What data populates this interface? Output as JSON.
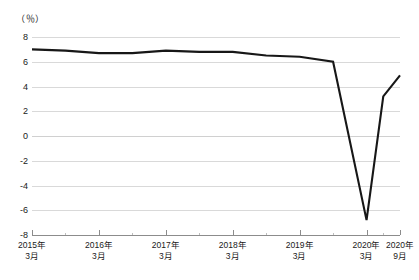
{
  "chart_data": {
    "type": "line",
    "title": "",
    "xlabel": "",
    "ylabel": "",
    "unit_label": "（％）",
    "ylim": [
      -8,
      8
    ],
    "ytick_labels": [
      "8",
      "6",
      "4",
      "2",
      "0",
      "-2",
      "-4",
      "-6",
      "-8"
    ],
    "ytick_values": [
      8,
      6,
      4,
      2,
      0,
      -2,
      -4,
      -6,
      -8
    ],
    "grid": true,
    "legend": "none",
    "categories": [
      "2015年3月",
      "2015年9月",
      "2016年3月",
      "2016年9月",
      "2017年3月",
      "2017年9月",
      "2018年3月",
      "2018年9月",
      "2019年3月",
      "2019年9月",
      "2020年3月",
      "2020年6月",
      "2020年9月"
    ],
    "xtick_labels": [
      {
        "year": "2015年",
        "month": "3月"
      },
      {
        "year": "2016年",
        "month": "3月"
      },
      {
        "year": "2017年",
        "month": "3月"
      },
      {
        "year": "2018年",
        "month": "3月"
      },
      {
        "year": "2019年",
        "month": "3月"
      },
      {
        "year": "2020年",
        "month": "3月"
      },
      {
        "year": "2020年",
        "month": "9月"
      }
    ],
    "series": [
      {
        "name": "実質GDP成長率",
        "color": "#171717",
        "values": [
          7.0,
          6.9,
          6.7,
          6.7,
          6.9,
          6.8,
          6.8,
          6.5,
          6.4,
          6.0,
          -6.8,
          3.2,
          4.9
        ]
      }
    ],
    "annotations": {
      "trough_value": -6.8,
      "trough_label": "2020年3月",
      "final_value": 4.9
    }
  }
}
